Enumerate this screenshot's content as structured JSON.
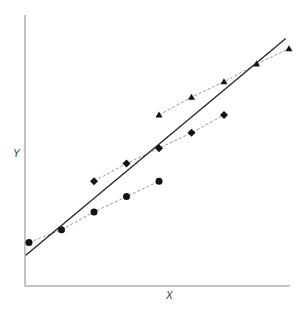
{
  "chart_data": {
    "type": "scatter",
    "title": "",
    "xlabel": "X",
    "ylabel": "Y",
    "grid": false,
    "legend": null,
    "series": [
      {
        "name": "circles",
        "marker": "circle",
        "line": "dashed",
        "x": [
          0,
          1,
          2,
          3,
          4
        ],
        "y": [
          1.0,
          1.5,
          2.2,
          2.8,
          3.4
        ]
      },
      {
        "name": "diamonds",
        "marker": "diamond",
        "line": "dashed",
        "x": [
          2,
          3,
          4,
          5,
          6
        ],
        "y": [
          3.4,
          4.1,
          4.7,
          5.3,
          6.0
        ]
      },
      {
        "name": "triangles",
        "marker": "triangle",
        "line": "dashed",
        "x": [
          4,
          5,
          6,
          7,
          8
        ],
        "y": [
          6.0,
          6.7,
          7.3,
          8.0,
          8.6
        ]
      },
      {
        "name": "fit",
        "marker": "none",
        "line": "solid",
        "x": [
          -0.1,
          7.9
        ],
        "y": [
          0.5,
          9.0
        ]
      }
    ]
  },
  "labels": {
    "x": "X",
    "y": "Y"
  }
}
